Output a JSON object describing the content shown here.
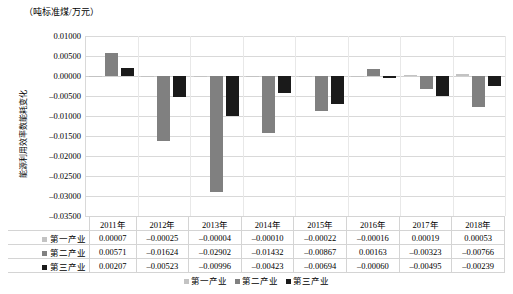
{
  "chart_data": {
    "type": "bar",
    "title": "",
    "unit_caption": "（吨标准煤/万元）",
    "ylabel": "能源利用效率数能耗变化",
    "xlabel": "",
    "categories": [
      "2011年",
      "2012年",
      "2013年",
      "2014年",
      "2015年",
      "2016年",
      "2017年",
      "2018年"
    ],
    "series": [
      {
        "name": "第一产业",
        "color": "#c3c3c3",
        "values": [
          7e-05,
          -0.00025,
          -4e-05,
          -0.0001,
          -0.00022,
          -0.00016,
          0.00019,
          0.00053
        ],
        "labels": [
          "0.00007",
          "-0.00025",
          "-0.00004",
          "-0.00010",
          "-0.00022",
          "-0.00016",
          "0.00019",
          "0.00053"
        ]
      },
      {
        "name": "第二产业",
        "color": "#808080",
        "values": [
          0.00571,
          -0.01624,
          -0.02902,
          -0.01432,
          -0.00867,
          0.00163,
          -0.00323,
          -0.00766
        ],
        "labels": [
          "0.00571",
          "-0.01624",
          "-0.02902",
          "-0.01432",
          "-0.00867",
          "0.00163",
          "-0.00323",
          "-0.00766"
        ]
      },
      {
        "name": "第三产业",
        "color": "#1a1a1a",
        "values": [
          0.00207,
          -0.00523,
          -0.00996,
          -0.00423,
          -0.00694,
          -0.0006,
          -0.00495,
          -0.00239
        ],
        "labels": [
          "0.00207",
          "-0.00523",
          "-0.00996",
          "-0.00423",
          "-0.00694",
          "-0.00060",
          "-0.00495",
          "-0.00239"
        ]
      }
    ],
    "ylim": [
      -0.035,
      0.01
    ],
    "ytick_step": 0.005,
    "ytick_labels": [
      "0.01000",
      "0.00500",
      "0.00000",
      "-0.00500",
      "-0.01000",
      "-0.01500",
      "-0.02000",
      "-0.02500",
      "-0.03000",
      "-0.03500"
    ],
    "grid": true,
    "legend_position": "bottom",
    "data_table_visible": true
  },
  "legend": {
    "items": [
      {
        "label": "第一产业"
      },
      {
        "label": "第二产业"
      },
      {
        "label": "第三产业"
      }
    ]
  }
}
